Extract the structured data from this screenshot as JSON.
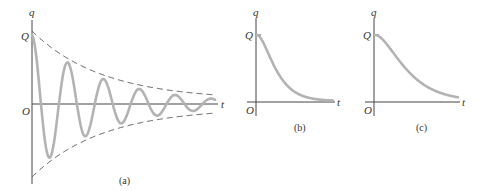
{
  "figure": {
    "panels": [
      {
        "id": "a",
        "caption": "(a)",
        "y_label": "q",
        "x_label": "t",
        "origin_label": "O",
        "y_tick_label": "Q",
        "description": "Underdamped oscillation of charge q with exponentially decaying dashed envelope"
      },
      {
        "id": "b",
        "caption": "(b)",
        "y_label": "q",
        "x_label": "t",
        "origin_label": "O",
        "y_tick_label": "Q",
        "description": "Critically damped decay of charge q to zero"
      },
      {
        "id": "c",
        "caption": "(c)",
        "y_label": "q",
        "x_label": "t",
        "origin_label": "O",
        "y_tick_label": "Q",
        "description": "Overdamped, slower decay of charge q to zero"
      }
    ]
  },
  "colors": {
    "curve": "#b3b3b3",
    "axis": "#444444",
    "envelope": "#555555",
    "text": "#333333"
  }
}
